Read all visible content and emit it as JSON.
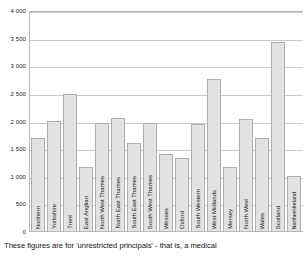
{
  "chart_data": {
    "type": "bar",
    "title": "",
    "subtitle": "",
    "xlabel": "",
    "ylabel": "",
    "ylim": [
      0,
      4000
    ],
    "grid": true,
    "legend": "none",
    "y_ticks": [
      "0",
      "500",
      "1 000",
      "1 500",
      "2 000",
      "2 500",
      "3 000",
      "3 500",
      "4 000"
    ],
    "y_tick_values": [
      0,
      500,
      1000,
      1500,
      2000,
      2500,
      3000,
      3500,
      4000
    ],
    "categories": [
      "Northern",
      "Yorkshire",
      "Trent",
      "East Anglian",
      "North West Thames",
      "North East Thames",
      "South East Thames",
      "South West Thames",
      "Wessex",
      "Oxford",
      "South Western",
      "West Midlands",
      "Mersey",
      "North West",
      "Wales",
      "Scotland",
      "Northern Ireland"
    ],
    "values": [
      1690,
      2000,
      2480,
      1160,
      1960,
      2040,
      1590,
      1960,
      1390,
      1320,
      1930,
      2750,
      1160,
      2030,
      1690,
      3430,
      1000
    ]
  },
  "caption": {
    "text": "These figures are for 'unrestricted principals' - that is, a medical"
  }
}
